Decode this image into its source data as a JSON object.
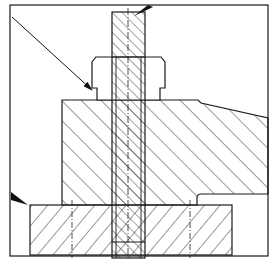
{
  "figure": {
    "type": "sectional technical drawing",
    "caption": "",
    "caption_note": "caption text is cropped at the bottom edge and not legible"
  },
  "colors": {
    "line": "#1a1a1a",
    "hatch": "#333333",
    "background": "#ffffff"
  },
  "parts": [
    {
      "name": "bolt",
      "hatch": "fine diagonal"
    },
    {
      "name": "nut",
      "hatch": "none (outline)"
    },
    {
      "name": "clamp-block",
      "hatch": "wide diagonal"
    },
    {
      "name": "base-plate",
      "hatch": "reverse diagonal"
    }
  ],
  "arrows": [
    {
      "name": "leader-arrow-nut"
    },
    {
      "name": "leader-arrow-bolt-top"
    },
    {
      "name": "leader-arrow-plate"
    }
  ]
}
